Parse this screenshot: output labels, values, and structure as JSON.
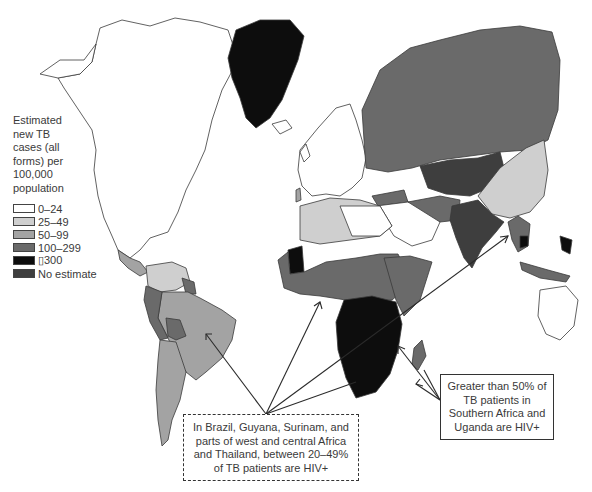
{
  "legend": {
    "title_lines": [
      "Estimated",
      "new TB",
      "cases (all",
      "forms) per",
      "100,000",
      "population"
    ],
    "items": [
      {
        "label": "0–24",
        "color": "#ffffff"
      },
      {
        "label": "25–49",
        "color": "#cfcfcf"
      },
      {
        "label": "50–99",
        "color": "#a3a3a3"
      },
      {
        "label": "100–299",
        "color": "#6a6a6a"
      },
      {
        "label": "▯300",
        "color": "#0d0d0d"
      },
      {
        "label": "No estimate",
        "color": "#3e3e3e"
      }
    ]
  },
  "callouts": {
    "dashed": {
      "text": "In Brazil, Guyana, Surinam, and parts of west and central Africa and Thailand, between 20–49% of TB patients are HIV+"
    },
    "solid": {
      "text": "Greater than 50% of TB patients in Southern Africa and Uganda are HIV+"
    }
  },
  "regions": {
    "greenland": "≥300",
    "russia": "100–299",
    "china": "50–99",
    "india": "100–299",
    "brazil": "50–99",
    "southern_africa": "≥300",
    "north_america": "0–24",
    "western_europe": "0–24"
  }
}
